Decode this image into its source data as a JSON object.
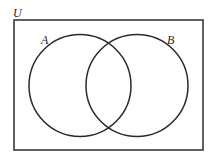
{
  "diagram": {
    "type": "venn",
    "universe": {
      "label": "U",
      "rect": {
        "x": 14,
        "y": 20,
        "width": 189,
        "height": 130
      }
    },
    "sets": [
      {
        "label": "A",
        "cx": 80,
        "cy": 85.5,
        "r": 51,
        "label_x": 41,
        "label_y": 44
      },
      {
        "label": "B",
        "cx": 137,
        "cy": 85.5,
        "r": 51,
        "label_x": 167,
        "label_y": 44
      }
    ],
    "stroke_color": "#2a2a2a",
    "background": "#ffffff"
  }
}
